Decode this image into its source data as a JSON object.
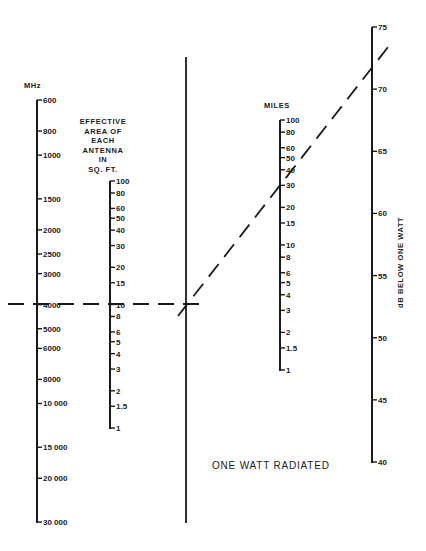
{
  "chart_data": {
    "type": "nomograph",
    "title": "",
    "caption": "ONE WATT RADIATED",
    "colors": {
      "ink": "#1a1a1a",
      "background": "#ffffff"
    },
    "axes": [
      {
        "id": "frequency",
        "label": "MHz",
        "scale": "log",
        "range": [
          600,
          30000
        ],
        "ticks": [
          {
            "value": 600,
            "label": "600"
          },
          {
            "value": 800,
            "label": "800"
          },
          {
            "value": 1000,
            "label": "1000"
          },
          {
            "value": 1500,
            "label": "1500"
          },
          {
            "value": 2000,
            "label": "2000"
          },
          {
            "value": 2500,
            "label": "2500"
          },
          {
            "value": 3000,
            "label": "3000"
          },
          {
            "value": 4000,
            "label": "4000"
          },
          {
            "value": 5000,
            "label": "5000"
          },
          {
            "value": 6000,
            "label": "6000"
          },
          {
            "value": 8000,
            "label": "8000"
          },
          {
            "value": 10000,
            "label": "10 000"
          },
          {
            "value": 15000,
            "label": "15 000"
          },
          {
            "value": 20000,
            "label": "20 000"
          },
          {
            "value": 30000,
            "label": "30 000"
          }
        ]
      },
      {
        "id": "antenna_area",
        "label_lines": [
          "EFFECTIVE",
          "AREA OF",
          "EACH",
          "ANTENNA",
          "IN",
          "SQ. FT."
        ],
        "scale": "log",
        "range": [
          1,
          100
        ],
        "ticks": [
          {
            "value": 100,
            "label": "100"
          },
          {
            "value": 80,
            "label": "80"
          },
          {
            "value": 60,
            "label": "60"
          },
          {
            "value": 50,
            "label": "50"
          },
          {
            "value": 40,
            "label": "40"
          },
          {
            "value": 30,
            "label": "30"
          },
          {
            "value": 20,
            "label": "20"
          },
          {
            "value": 15,
            "label": "15"
          },
          {
            "value": 10,
            "label": "10"
          },
          {
            "value": 8,
            "label": "8"
          },
          {
            "value": 6,
            "label": "6"
          },
          {
            "value": 5,
            "label": "5"
          },
          {
            "value": 4,
            "label": "4"
          },
          {
            "value": 3,
            "label": "3"
          },
          {
            "value": 2,
            "label": "2"
          },
          {
            "value": 1.5,
            "label": "1.5"
          },
          {
            "value": 1,
            "label": "1"
          }
        ]
      },
      {
        "id": "reference_line",
        "label": "",
        "scale": "none"
      },
      {
        "id": "distance",
        "label": "MILES",
        "scale": "log",
        "range": [
          1,
          100
        ],
        "ticks": [
          {
            "value": 100,
            "label": "100"
          },
          {
            "value": 80,
            "label": "80"
          },
          {
            "value": 60,
            "label": "60"
          },
          {
            "value": 50,
            "label": "50"
          },
          {
            "value": 40,
            "label": "40"
          },
          {
            "value": 30,
            "label": "30"
          },
          {
            "value": 20,
            "label": "20"
          },
          {
            "value": 15,
            "label": "15"
          },
          {
            "value": 10,
            "label": "10"
          },
          {
            "value": 8,
            "label": "8"
          },
          {
            "value": 6,
            "label": "6"
          },
          {
            "value": 5,
            "label": "5"
          },
          {
            "value": 4,
            "label": "4"
          },
          {
            "value": 3,
            "label": "3"
          },
          {
            "value": 2,
            "label": "2"
          },
          {
            "value": 1.5,
            "label": "1.5"
          },
          {
            "value": 1,
            "label": "1"
          }
        ]
      },
      {
        "id": "loss",
        "label": "dB BELOW ONE WATT",
        "scale": "linear",
        "range": [
          40,
          75
        ],
        "ticks": [
          {
            "value": 75,
            "label": "75"
          },
          {
            "value": 70,
            "label": "70"
          },
          {
            "value": 65,
            "label": "65"
          },
          {
            "value": 60,
            "label": "60"
          },
          {
            "value": 55,
            "label": "55"
          },
          {
            "value": 50,
            "label": "50"
          },
          {
            "value": 45,
            "label": "45"
          },
          {
            "value": 40,
            "label": "40"
          }
        ]
      }
    ],
    "example": {
      "frequency_mhz": 4000,
      "antenna_area_sqft": 10,
      "distance_miles": 30,
      "loss_db": 71.5
    }
  }
}
